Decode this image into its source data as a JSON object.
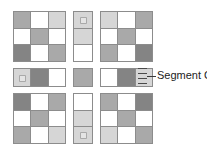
{
  "figure": {
    "title": "Segment C",
    "palette": {
      "white": "#ffffff",
      "light_gray": "#d6d6d6",
      "mid_gray": "#a9a9a9",
      "dark_gray": "#848484",
      "grid_line": "#8c8c8c",
      "label_text": "#1c1c1c",
      "leader_line": "#3a3a3a",
      "background": "#ffffff"
    }
  },
  "callout": {
    "label": "Segment C",
    "leader_ticks": 4
  },
  "blocks": {
    "top_left": {
      "name": "top-left-grid",
      "rows": 3,
      "cols": 3,
      "x": 13,
      "y": 11,
      "w": 53,
      "h": 51,
      "cells": [
        "mid",
        "white",
        "light",
        "white",
        "mid",
        "white",
        "dark",
        "white",
        "mid"
      ]
    },
    "top_center": {
      "name": "top-center-strip",
      "rows": 3,
      "cols": 1,
      "x": 73,
      "y": 11,
      "w": 20,
      "h": 51,
      "cells": [
        "light",
        "light",
        "white"
      ],
      "speckle_cells": [
        0
      ]
    },
    "top_right": {
      "name": "top-right-grid",
      "rows": 3,
      "cols": 3,
      "x": 100,
      "y": 11,
      "w": 53,
      "h": 51,
      "cells": [
        "light",
        "white",
        "mid",
        "white",
        "mid",
        "white",
        "mid",
        "white",
        "dark"
      ]
    },
    "mid_left": {
      "name": "middle-left-strip",
      "rows": 1,
      "cols": 3,
      "x": 13,
      "y": 68,
      "w": 53,
      "h": 19,
      "cells": [
        "light",
        "dark",
        "white"
      ],
      "speckle_cells": [
        0
      ]
    },
    "mid_center": {
      "name": "middle-center-cell",
      "rows": 1,
      "cols": 1,
      "x": 73,
      "y": 68,
      "w": 20,
      "h": 19,
      "cells": [
        "mid"
      ]
    },
    "mid_right": {
      "name": "middle-right-strip",
      "rows": 1,
      "cols": 3,
      "x": 100,
      "y": 68,
      "w": 53,
      "h": 19,
      "cells": [
        "white",
        "dark",
        "light"
      ]
    },
    "bottom_left": {
      "name": "bottom-left-grid",
      "rows": 3,
      "cols": 3,
      "x": 13,
      "y": 93,
      "w": 53,
      "h": 51,
      "cells": [
        "dark",
        "white",
        "mid",
        "white",
        "mid",
        "white",
        "mid",
        "white",
        "light"
      ]
    },
    "bottom_center": {
      "name": "bottom-center-strip",
      "rows": 3,
      "cols": 1,
      "x": 73,
      "y": 93,
      "w": 20,
      "h": 51,
      "cells": [
        "white",
        "light",
        "light"
      ],
      "speckle_cells": [
        2
      ]
    },
    "bottom_right": {
      "name": "bottom-right-grid",
      "rows": 3,
      "cols": 3,
      "x": 100,
      "y": 93,
      "w": 53,
      "h": 51,
      "cells": [
        "mid",
        "white",
        "dark",
        "white",
        "mid",
        "white",
        "light",
        "white",
        "mid"
      ]
    }
  }
}
